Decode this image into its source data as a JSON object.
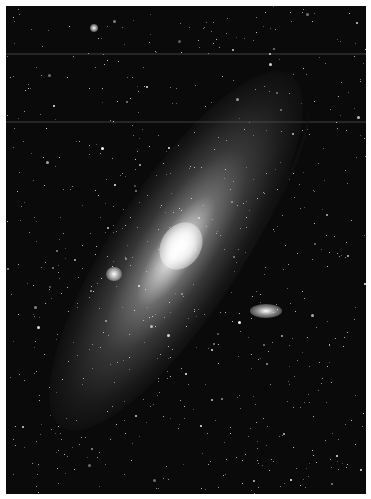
{
  "image": {
    "subject": "Andromeda Galaxy (M31) with satellite galaxies",
    "description": "Grayscale astrophotograph of a large spiral galaxy seen at an angle, diagonal from lower-left to upper-right, bright core, dark dust lanes, two small companion galaxies, dense star field, thin white border."
  }
}
